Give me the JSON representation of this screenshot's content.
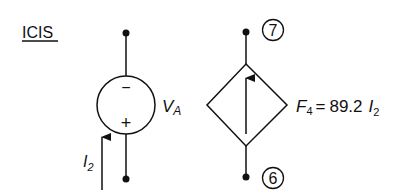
{
  "title": "ICIS",
  "left_element": {
    "type": "independent-voltage-source",
    "label_main": "V",
    "label_sub": "A",
    "polarity_top": "−",
    "polarity_bottom": "+",
    "current_label_main": "I",
    "current_label_sub": "2"
  },
  "right_element": {
    "type": "dependent-current-source",
    "node_top": "7",
    "node_bottom": "6",
    "label_main": "F",
    "label_sub": "4",
    "equals": "=",
    "gain": "89.2",
    "control_main": "I",
    "control_sub": "2"
  },
  "colors": {
    "stroke": "#111111",
    "background": "#ffffff"
  }
}
